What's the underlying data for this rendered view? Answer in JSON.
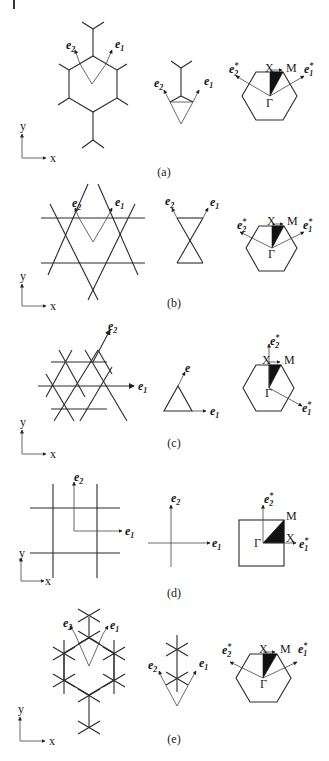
{
  "figure": {
    "panels": [
      {
        "id": "a",
        "caption": "(a)",
        "real_space": {
          "vector_labels": [
            "e2",
            "e1"
          ],
          "lattice": "decorated honeycomb"
        },
        "unit_cell": {
          "vector_labels": [
            "e2",
            "e1"
          ]
        },
        "brillouin_zone": {
          "shape": "hexagon",
          "points": [
            "X",
            "M",
            "Γ"
          ],
          "reciprocal_labels": [
            "e2*",
            "e1*"
          ]
        }
      },
      {
        "id": "b",
        "caption": "(b)",
        "real_space": {
          "vector_labels": [
            "e2",
            "e1"
          ],
          "lattice": "kagome"
        },
        "unit_cell": {
          "vector_labels": [
            "e2",
            "e1"
          ]
        },
        "brillouin_zone": {
          "shape": "hexagon",
          "points": [
            "X",
            "M",
            "Γ"
          ],
          "reciprocal_labels": [
            "e2*",
            "e1*"
          ]
        }
      },
      {
        "id": "c",
        "caption": "(c)",
        "real_space": {
          "vector_labels": [
            "e2",
            "e1"
          ],
          "lattice": "triangular"
        },
        "unit_cell": {
          "vector_labels": [
            "e",
            "e1"
          ]
        },
        "brillouin_zone": {
          "shape": "hexagon",
          "points": [
            "X",
            "M",
            "Γ"
          ],
          "reciprocal_labels": [
            "e2*",
            "e1*"
          ]
        }
      },
      {
        "id": "d",
        "caption": "(d)",
        "real_space": {
          "vector_labels": [
            "e2",
            "e1"
          ],
          "lattice": "square"
        },
        "unit_cell": {
          "vector_labels": [
            "e2",
            "e1"
          ]
        },
        "brillouin_zone": {
          "shape": "square",
          "points": [
            "M",
            "Γ",
            "X"
          ],
          "reciprocal_labels": [
            "e2*",
            "e1*"
          ]
        }
      },
      {
        "id": "e",
        "caption": "(e)",
        "real_space": {
          "vector_labels": [
            "e2",
            "e1"
          ],
          "lattice": "star decorated"
        },
        "unit_cell": {
          "vector_labels": [
            "e2",
            "e1"
          ]
        },
        "brillouin_zone": {
          "shape": "hexagon",
          "points": [
            "X",
            "M",
            "Γ"
          ],
          "reciprocal_labels": [
            "e2*",
            "e1*"
          ]
        }
      }
    ],
    "axes": {
      "x_label": "x",
      "y_label": "y"
    },
    "labels": {
      "e1": "e",
      "e1_sub": "1",
      "e2": "e",
      "e2_sub": "2",
      "e": "e",
      "star": "*",
      "X": "X",
      "M": "M",
      "Gamma": "Γ"
    }
  }
}
